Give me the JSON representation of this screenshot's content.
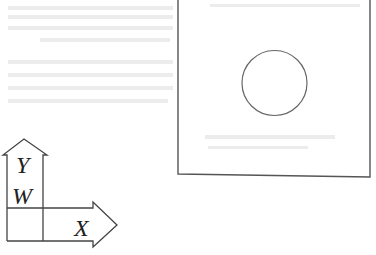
{
  "figure": {
    "type": "patent-style line drawing",
    "colors": {
      "stroke": "#555555",
      "background": "#ffffff",
      "label": "#222222"
    },
    "workpiece": {
      "shape": "rectangle",
      "x": 178,
      "y": -5,
      "width": 192,
      "height": 181,
      "feature": {
        "shape": "circle",
        "cx": 274.5,
        "cy": 83,
        "r": 32.5
      }
    },
    "axes": {
      "labels": {
        "y": "Y",
        "w": "W",
        "x": "X"
      },
      "y_arrow": {
        "direction": "up"
      },
      "x_arrow": {
        "direction": "right"
      }
    }
  },
  "bleed_through_text": {
    "note": "illegible reverse-side text visible faintly through the page",
    "lines": [
      "",
      "",
      "",
      "",
      "",
      "",
      "",
      "",
      ""
    ]
  }
}
